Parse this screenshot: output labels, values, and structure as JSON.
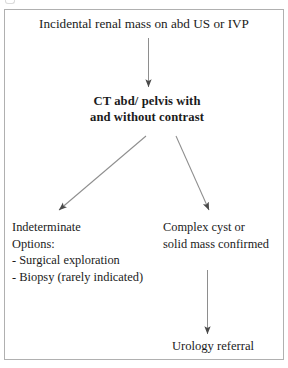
{
  "diagram": {
    "title": "Incidental renal mass on abd US or IVP",
    "type": "flowchart",
    "background_color": "#ffffff",
    "border_color": "#b0b0b0",
    "text_color": "#1b1b1b",
    "nodes": [
      {
        "id": "start",
        "label": "Incidental renal mass on abd US or IVP",
        "emphasis": "normal"
      },
      {
        "id": "ct",
        "label": "CT abd/ pelvis with\nand without contrast",
        "emphasis": "bold"
      },
      {
        "id": "indeterminate",
        "label": "Indeterminate\nOptions:\n- Surgical exploration\n- Biopsy (rarely indicated)",
        "emphasis": "normal"
      },
      {
        "id": "complex",
        "label": "Complex cyst or\nsolid mass confirmed",
        "emphasis": "normal"
      },
      {
        "id": "urology",
        "label": "Urology referral",
        "emphasis": "normal"
      }
    ],
    "edges": [
      {
        "id": "start-to-ct",
        "from": "start",
        "to": "ct",
        "direction": "down"
      },
      {
        "id": "ct-to-indeterminate",
        "from": "ct",
        "to": "indeterminate",
        "direction": "down-left"
      },
      {
        "id": "ct-to-complex",
        "from": "ct",
        "to": "complex",
        "direction": "down-right"
      },
      {
        "id": "complex-to-urology",
        "from": "complex",
        "to": "urology",
        "direction": "down"
      }
    ]
  }
}
